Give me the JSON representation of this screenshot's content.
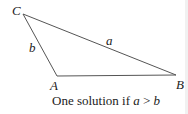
{
  "diagram": {
    "vertices": [
      {
        "name": "C",
        "x": 23,
        "y": 14
      },
      {
        "name": "A",
        "x": 57,
        "y": 76
      },
      {
        "name": "B",
        "x": 176,
        "y": 75
      }
    ],
    "labels": {
      "C": "C",
      "A": "A",
      "B": "B",
      "side_b": "b",
      "side_a": "a"
    },
    "caption_prefix": "One solution if ",
    "caption_var1": "a",
    "caption_op": " > ",
    "caption_var2": "b",
    "line_color": "#555555"
  }
}
